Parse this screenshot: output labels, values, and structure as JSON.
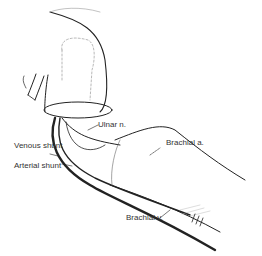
{
  "figure": {
    "labels": {
      "ulnar_n": "Ulnar n.",
      "venous_shunt": "Venous shunt",
      "arterial_shunt": "Arterial shunt",
      "brachial_a": "Brachial a.",
      "brachial_v": "Brachial v."
    }
  }
}
